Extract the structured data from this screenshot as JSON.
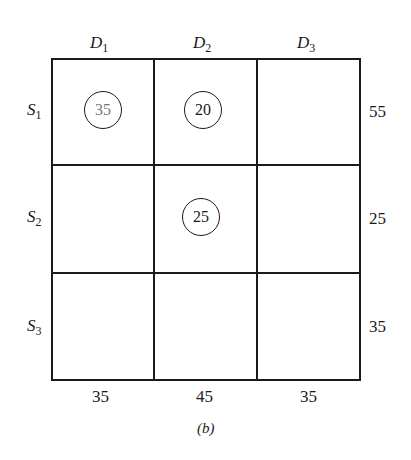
{
  "demand_labels": [
    {
      "letter": "D",
      "sub": "1"
    },
    {
      "letter": "D",
      "sub": "2"
    },
    {
      "letter": "D",
      "sub": "3"
    }
  ],
  "supply_labels": [
    {
      "letter": "S",
      "sub": "1"
    },
    {
      "letter": "S",
      "sub": "2"
    },
    {
      "letter": "S",
      "sub": "3"
    }
  ],
  "supply_values": [
    "55",
    "25",
    "35"
  ],
  "demand_values": [
    "35",
    "45",
    "35"
  ],
  "allocations": [
    {
      "row": 1,
      "col": 1,
      "value": "35"
    },
    {
      "row": 1,
      "col": 2,
      "value": "20"
    },
    {
      "row": 2,
      "col": 2,
      "value": "25"
    }
  ],
  "caption": "(b)"
}
